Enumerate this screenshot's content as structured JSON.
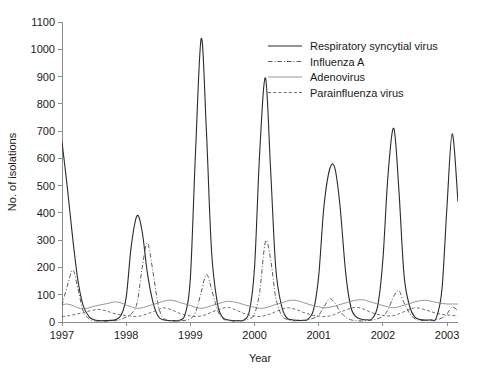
{
  "chart_data": {
    "type": "line",
    "title": "",
    "xlabel": "Year",
    "ylabel": "No. of isolations",
    "xlim": [
      1997.0,
      2003.17
    ],
    "ylim": [
      0,
      1100
    ],
    "grid": false,
    "legend_position": "top-right",
    "x_tick_labels": [
      "1997",
      "1998",
      "1999",
      "2000",
      "2001",
      "2002",
      "2003"
    ],
    "x_ticks": [
      1997,
      1998,
      1999,
      2000,
      2001,
      2002,
      2003
    ],
    "y_tick_labels": [
      "0",
      "100",
      "200",
      "300",
      "400",
      "500",
      "600",
      "700",
      "800",
      "900",
      "1000",
      "1100"
    ],
    "y_ticks": [
      0,
      100,
      200,
      300,
      400,
      500,
      600,
      700,
      800,
      900,
      1000,
      1100
    ],
    "series": [
      {
        "name": "Respiratory syncytial virus",
        "style": "solid",
        "color": "#2b2b2b",
        "width": 1.1,
        "x": [
          1997.0,
          1997.08,
          1997.17,
          1997.25,
          1997.33,
          1997.42,
          1997.5,
          1997.58,
          1997.67,
          1997.75,
          1997.83,
          1997.92,
          1998.0,
          1998.08,
          1998.17,
          1998.25,
          1998.33,
          1998.42,
          1998.5,
          1998.58,
          1998.67,
          1998.75,
          1998.83,
          1998.92,
          1999.0,
          1999.08,
          1999.17,
          1999.25,
          1999.33,
          1999.42,
          1999.5,
          1999.58,
          1999.67,
          1999.75,
          1999.83,
          1999.92,
          2000.0,
          2000.08,
          2000.17,
          2000.25,
          2000.33,
          2000.42,
          2000.5,
          2000.58,
          2000.67,
          2000.75,
          2000.83,
          2000.92,
          2001.0,
          2001.08,
          2001.17,
          2001.25,
          2001.33,
          2001.42,
          2001.5,
          2001.58,
          2001.67,
          2001.75,
          2001.83,
          2001.92,
          2002.0,
          2002.08,
          2002.17,
          2002.25,
          2002.33,
          2002.42,
          2002.5,
          2002.58,
          2002.67,
          2002.75,
          2002.83,
          2002.92,
          2003.0,
          2003.08,
          2003.17
        ],
        "y": [
          660,
          500,
          300,
          150,
          60,
          20,
          8,
          5,
          5,
          6,
          8,
          25,
          90,
          280,
          390,
          330,
          180,
          70,
          20,
          8,
          5,
          5,
          6,
          30,
          160,
          620,
          1040,
          700,
          260,
          70,
          18,
          8,
          5,
          5,
          7,
          40,
          200,
          620,
          895,
          560,
          200,
          60,
          16,
          8,
          6,
          6,
          10,
          45,
          170,
          420,
          560,
          565,
          430,
          180,
          55,
          20,
          10,
          8,
          12,
          60,
          230,
          540,
          710,
          480,
          170,
          55,
          18,
          9,
          7,
          8,
          14,
          120,
          430,
          690,
          440
        ]
      },
      {
        "name": "Influenza A",
        "style": "dashdot",
        "color": "#4a4a4a",
        "width": 0.9,
        "x": [
          1997.0,
          1997.08,
          1997.17,
          1997.25,
          1997.33,
          1997.42,
          1997.5,
          1997.58,
          1997.67,
          1997.75,
          1997.83,
          1997.92,
          1998.0,
          1998.08,
          1998.17,
          1998.25,
          1998.33,
          1998.42,
          1998.5,
          1998.58,
          1998.67,
          1998.75,
          1998.83,
          1998.92,
          1999.0,
          1999.08,
          1999.17,
          1999.25,
          1999.33,
          1999.42,
          1999.5,
          1999.58,
          1999.67,
          1999.75,
          1999.83,
          1999.92,
          2000.0,
          2000.08,
          2000.17,
          2000.25,
          2000.33,
          2000.42,
          2000.5,
          2000.58,
          2000.67,
          2000.75,
          2000.83,
          2000.92,
          2001.0,
          2001.08,
          2001.17,
          2001.25,
          2001.33,
          2001.42,
          2001.5,
          2001.58,
          2001.67,
          2001.75,
          2001.83,
          2001.92,
          2002.0,
          2002.08,
          2002.17,
          2002.25,
          2002.33,
          2002.42,
          2002.5,
          2002.58,
          2002.67,
          2002.75,
          2002.83,
          2002.92,
          2003.0,
          2003.08,
          2003.17
        ],
        "y": [
          60,
          130,
          190,
          120,
          40,
          12,
          5,
          3,
          3,
          4,
          5,
          10,
          18,
          30,
          70,
          200,
          290,
          180,
          60,
          15,
          6,
          4,
          4,
          6,
          12,
          35,
          110,
          175,
          120,
          45,
          14,
          6,
          4,
          4,
          6,
          12,
          30,
          110,
          295,
          230,
          90,
          25,
          10,
          5,
          4,
          5,
          8,
          14,
          25,
          55,
          85,
          70,
          40,
          18,
          8,
          5,
          4,
          5,
          7,
          12,
          22,
          45,
          95,
          115,
          70,
          30,
          12,
          6,
          5,
          5,
          8,
          15,
          30,
          55,
          40
        ]
      },
      {
        "name": "Adenovirus",
        "style": "solid",
        "color": "#7d7d7d",
        "width": 0.8,
        "x": [
          1997.0,
          1997.08,
          1997.17,
          1997.25,
          1997.33,
          1997.42,
          1997.5,
          1997.58,
          1997.67,
          1997.75,
          1997.83,
          1997.92,
          1998.0,
          1998.08,
          1998.17,
          1998.25,
          1998.33,
          1998.42,
          1998.5,
          1998.58,
          1998.67,
          1998.75,
          1998.83,
          1998.92,
          1999.0,
          1999.08,
          1999.17,
          1999.25,
          1999.33,
          1999.42,
          1999.5,
          1999.58,
          1999.67,
          1999.75,
          1999.83,
          1999.92,
          2000.0,
          2000.08,
          2000.17,
          2000.25,
          2000.33,
          2000.42,
          2000.5,
          2000.58,
          2000.67,
          2000.75,
          2000.83,
          2000.92,
          2001.0,
          2001.08,
          2001.17,
          2001.25,
          2001.33,
          2001.42,
          2001.5,
          2001.58,
          2001.67,
          2001.75,
          2001.83,
          2001.92,
          2002.0,
          2002.08,
          2002.17,
          2002.25,
          2002.33,
          2002.42,
          2002.5,
          2002.58,
          2002.67,
          2002.75,
          2002.83,
          2002.92,
          2003.0,
          2003.08,
          2003.17
        ],
        "y": [
          62,
          66,
          60,
          52,
          48,
          52,
          58,
          62,
          66,
          70,
          74,
          70,
          62,
          56,
          50,
          52,
          58,
          64,
          70,
          76,
          80,
          78,
          72,
          66,
          60,
          54,
          50,
          54,
          60,
          66,
          72,
          76,
          74,
          70,
          64,
          58,
          54,
          50,
          52,
          58,
          64,
          70,
          76,
          80,
          78,
          72,
          66,
          60,
          56,
          52,
          54,
          58,
          64,
          70,
          76,
          80,
          82,
          78,
          72,
          66,
          60,
          56,
          52,
          56,
          62,
          68,
          74,
          78,
          80,
          76,
          72,
          68,
          66,
          66,
          66
        ]
      },
      {
        "name": "Parainfluenza virus",
        "style": "dashed",
        "color": "#4a4a4a",
        "width": 0.8,
        "x": [
          1997.0,
          1997.08,
          1997.17,
          1997.25,
          1997.33,
          1997.42,
          1997.5,
          1997.58,
          1997.67,
          1997.75,
          1997.83,
          1997.92,
          1998.0,
          1998.08,
          1998.17,
          1998.25,
          1998.33,
          1998.42,
          1998.5,
          1998.58,
          1998.67,
          1998.75,
          1998.83,
          1998.92,
          1999.0,
          1999.08,
          1999.17,
          1999.25,
          1999.33,
          1999.42,
          1999.5,
          1999.58,
          1999.67,
          1999.75,
          1999.83,
          1999.92,
          2000.0,
          2000.08,
          2000.17,
          2000.25,
          2000.33,
          2000.42,
          2000.5,
          2000.58,
          2000.67,
          2000.75,
          2000.83,
          2000.92,
          2001.0,
          2001.08,
          2001.17,
          2001.25,
          2001.33,
          2001.42,
          2001.5,
          2001.58,
          2001.67,
          2001.75,
          2001.83,
          2001.92,
          2002.0,
          2002.08,
          2002.17,
          2002.25,
          2002.33,
          2002.42,
          2002.5,
          2002.58,
          2002.67,
          2002.75,
          2002.83,
          2002.92,
          2003.0,
          2003.08,
          2003.17
        ],
        "y": [
          20,
          22,
          26,
          30,
          34,
          40,
          44,
          46,
          42,
          36,
          30,
          26,
          24,
          22,
          20,
          24,
          30,
          38,
          46,
          52,
          48,
          40,
          32,
          26,
          22,
          20,
          22,
          28,
          36,
          44,
          50,
          54,
          48,
          40,
          32,
          26,
          22,
          20,
          24,
          30,
          38,
          46,
          52,
          50,
          44,
          36,
          30,
          24,
          22,
          20,
          22,
          28,
          36,
          44,
          50,
          54,
          50,
          42,
          34,
          28,
          24,
          22,
          24,
          30,
          38,
          46,
          52,
          50,
          44,
          38,
          32,
          28,
          26,
          24,
          22
        ]
      }
    ]
  }
}
